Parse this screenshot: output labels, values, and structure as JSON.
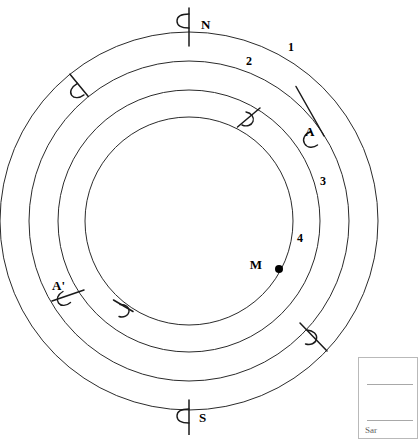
{
  "figure": {
    "center": {
      "x": 189,
      "y": 221
    },
    "stroke_color": "#2b2b2b",
    "background_color": "#ffffff",
    "circles": [
      {
        "id": "circle-1",
        "label": "1",
        "radius": 189,
        "label_x": 290,
        "label_y": 48
      },
      {
        "id": "circle-2",
        "label": "2",
        "radius": 160,
        "label_x": 249,
        "label_y": 62
      },
      {
        "id": "circle-3",
        "label": "3",
        "radius": 131,
        "label_x": 323,
        "label_y": 182
      },
      {
        "id": "circle-4",
        "label": "4",
        "radius": 104,
        "label_x": 300,
        "label_y": 239
      }
    ],
    "poles": [
      {
        "id": "pole-north",
        "label": "N",
        "label_x": 201,
        "label_y": 26,
        "axis_x": 189,
        "axis_y_top": 8,
        "axis_y_bottom": 46
      },
      {
        "id": "pole-south",
        "label": "S",
        "label_x": 199,
        "label_y": 419,
        "axis_x": 189,
        "axis_y_top": 400,
        "axis_y_bottom": 435
      }
    ],
    "points": [
      {
        "id": "point-m",
        "label": "M",
        "dot_x": 279,
        "dot_y": 269,
        "label_x": 265,
        "label_y": 266,
        "on_circle": "3"
      }
    ],
    "anchors": [
      {
        "id": "anchor-a",
        "label": "A",
        "label_x": 305,
        "label_y": 133,
        "angle_deg": 57
      },
      {
        "id": "anchor-a-prime",
        "label": "A'",
        "label_x": 57,
        "label_y": 287,
        "angle_deg": 237
      }
    ],
    "ticks": [
      {
        "id": "tick-outer-nw",
        "angle_deg": 129,
        "band": "1-2"
      },
      {
        "id": "tick-outer-ne",
        "angle_deg": 57,
        "band": "1-2"
      },
      {
        "id": "tick-outer-sw",
        "angle_deg": 237,
        "band": "1-2"
      },
      {
        "id": "tick-outer-se",
        "angle_deg": 311,
        "band": "1-2"
      },
      {
        "id": "tick-inner-ne",
        "angle_deg": 70,
        "band": "3-4"
      },
      {
        "id": "tick-inner-sw",
        "angle_deg": 248,
        "band": "3-4"
      }
    ]
  },
  "legend_panel": {
    "caption": "Sar",
    "visible_fragment": true
  }
}
